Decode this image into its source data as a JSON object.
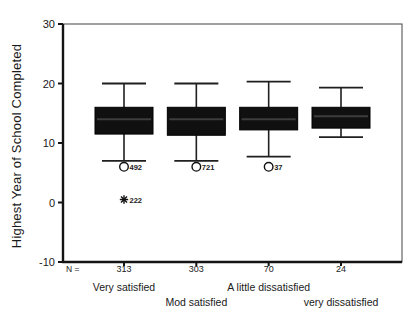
{
  "figure": {
    "y_axis_title": "Highest Year of School Completed",
    "n_prefix": "N ="
  },
  "chart_data": {
    "type": "boxplot",
    "title": "",
    "xlabel": "",
    "ylabel": "Highest Year of School Completed",
    "ylim": [
      -10,
      30
    ],
    "yticks": [
      30,
      20,
      10,
      0,
      -10
    ],
    "grid": false,
    "n_row_label": "N =",
    "categories": [
      "Very satisfied",
      "Mod satisfied",
      "A little dissatisfied",
      "very dissatisfied"
    ],
    "n_values": [
      "313",
      "303",
      "70",
      "24"
    ],
    "colors": {
      "background": "#ffffff",
      "box_fill": "#101010",
      "box_stroke": "#000000",
      "median_line": "#3d3d3d",
      "whisker": "#1f1f1f",
      "frame": "#454545",
      "axis": "#141414",
      "text": "#1a1a1a"
    },
    "series": [
      {
        "category": "Very satisfied",
        "n": "313",
        "whisker_low": 7,
        "q1": 11.5,
        "median": 14,
        "q3": 16,
        "whisker_high": 20,
        "outliers": [
          {
            "value": 6,
            "label": "492",
            "marker": "circle"
          }
        ],
        "extremes": [
          {
            "value": 0.5,
            "label": "222",
            "marker": "asterisk"
          }
        ]
      },
      {
        "category": "Mod satisfied",
        "n": "303",
        "whisker_low": 7,
        "q1": 11.3,
        "median": 14,
        "q3": 16,
        "whisker_high": 20,
        "outliers": [
          {
            "value": 6,
            "label": "721",
            "marker": "circle"
          }
        ],
        "extremes": []
      },
      {
        "category": "A little dissatisfied",
        "n": "70",
        "whisker_low": 7.7,
        "q1": 12.2,
        "median": 14,
        "q3": 16,
        "whisker_high": 20.3,
        "outliers": [
          {
            "value": 6,
            "label": "37",
            "marker": "circle"
          }
        ],
        "extremes": []
      },
      {
        "category": "very dissatisfied",
        "n": "24",
        "whisker_low": 11,
        "q1": 12.5,
        "median": 14.5,
        "q3": 16,
        "whisker_high": 19.3,
        "outliers": [],
        "extremes": []
      }
    ]
  }
}
